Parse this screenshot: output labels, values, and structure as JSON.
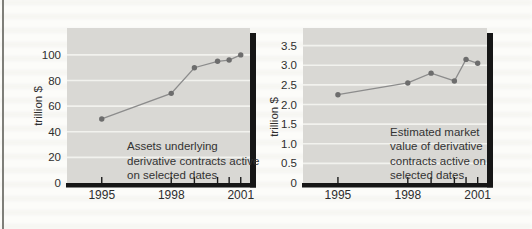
{
  "figure": {
    "description_left": "Assets underlying derivative contracts active on selected dates",
    "description_right": "Estimated market value of derivative contracts active on selected dates"
  },
  "colors": {
    "page_bg": "#fcfcf9",
    "plot_bg": "#d9d8d4",
    "gridline": "#f2f2ee",
    "line": "#8c8c8c",
    "point": "#6d6d6d",
    "axis": "#161616",
    "tick": "#1a1a1a",
    "text": "#333333",
    "tick_text": "#2e2e2e",
    "column_rule": "#7f7f79"
  },
  "chart_data": [
    {
      "type": "line",
      "title": "",
      "xlabel": "",
      "ylabel": "trillion $",
      "annotation_lines": [
        "Assets underlying",
        "derivative contracts active",
        "on selected dates"
      ],
      "x": [
        1995,
        1998,
        1999,
        2000,
        2000.5,
        2001
      ],
      "values": [
        50,
        70,
        90,
        95,
        96,
        100
      ],
      "xlim": [
        1993.5,
        2001.4
      ],
      "ylim": [
        0,
        121
      ],
      "grid": "horizontal",
      "legend": "none",
      "yticks": [
        0,
        20,
        40,
        60,
        80,
        100
      ],
      "ytick_labels": [
        "0",
        "20",
        "40",
        "60",
        "80",
        "100"
      ],
      "xticks": [
        1995,
        1998,
        1999,
        2000,
        2000.5,
        2001
      ],
      "xtick_labeled": [
        {
          "year": 1995,
          "label": "1995"
        },
        {
          "year": 1998,
          "label": "1998"
        },
        {
          "year": 2001,
          "label": "2001"
        }
      ]
    },
    {
      "type": "line",
      "title": "",
      "xlabel": "",
      "ylabel": "trillion $",
      "annotation_lines": [
        "Estimated market",
        "value of derivative",
        "contracts active on",
        "selected dates"
      ],
      "x": [
        1995,
        1998,
        1999,
        2000,
        2000.5,
        2001
      ],
      "values": [
        2.25,
        2.55,
        2.8,
        2.6,
        3.15,
        3.05
      ],
      "xlim": [
        1993.5,
        2001.4
      ],
      "ylim": [
        0,
        3.95
      ],
      "grid": "horizontal",
      "legend": "none",
      "yticks": [
        0,
        0.5,
        1.0,
        1.5,
        2.0,
        2.5,
        3.0,
        3.5
      ],
      "ytick_labels": [
        "0",
        "0.5",
        "1.0",
        "1.5",
        "2.0",
        "2.5",
        "3.0",
        "3.5"
      ],
      "xticks": [
        1995,
        1998,
        1999,
        2000,
        2000.5,
        2001
      ],
      "xtick_labeled": [
        {
          "year": 1995,
          "label": "1995"
        },
        {
          "year": 1998,
          "label": "1998"
        },
        {
          "year": 2001,
          "label": "2001"
        }
      ]
    }
  ]
}
